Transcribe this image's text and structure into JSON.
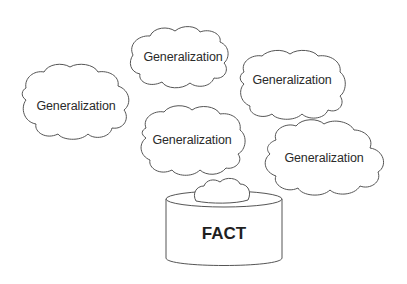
{
  "diagram": {
    "clouds": [
      {
        "label": "Generalization"
      },
      {
        "label": "Generalization"
      },
      {
        "label": "Generalization"
      },
      {
        "label": "Generalization"
      },
      {
        "label": "Generalization"
      }
    ],
    "container": {
      "label": "FACT"
    },
    "colors": {
      "stroke": "#555555",
      "text": "#2a2a2a",
      "background": "#ffffff"
    }
  }
}
